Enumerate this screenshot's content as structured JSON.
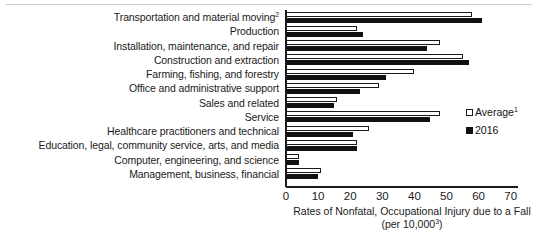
{
  "chart_data": {
    "type": "bar",
    "orientation": "horizontal",
    "title": "",
    "xlabel": "Rates of Nonfatal, Occupational Injury due to a Fall (per 10,000³)",
    "xlabel_line1": "Rates of Nonfatal, Occupational Injury due to a Fall",
    "xlabel_line2_prefix": "(per 10,000",
    "xlabel_line2_sup": "3",
    "xlabel_line2_suffix": ")",
    "ylabel": "",
    "xlim": [
      0,
      70
    ],
    "xticks": [
      0,
      10,
      20,
      30,
      40,
      50,
      60,
      70
    ],
    "xtick_labels": [
      "0",
      "10",
      "20",
      "30",
      "40",
      "50",
      "60",
      "70"
    ],
    "grid": false,
    "legend_position": "center-right",
    "categories": [
      "Transportation and material moving²",
      "Production",
      "Installation, maintenance, and repair",
      "Construction and extraction",
      "Farming, fishing, and forestry",
      "Office and administrative support",
      "Sales and related",
      "Service",
      "Healthcare practitioners and technical",
      "Education, legal, community service, arts, and media",
      "Computer, engineering, and science",
      "Management, business, financial"
    ],
    "categories_plain": [
      "Transportation and material moving",
      "Production",
      "Installation, maintenance, and repair",
      "Construction and extraction",
      "Farming, fishing, and forestry",
      "Office and administrative support",
      "Sales and related",
      "Service",
      "Healthcare practitioners and technical",
      "Education, legal, community service, arts, and media",
      "Computer, engineering, and science",
      "Management, business, financial"
    ],
    "category_footnotes": [
      "2",
      "",
      "",
      "",
      "",
      "",
      "",
      "",
      "",
      "",
      "",
      ""
    ],
    "series": [
      {
        "name": "Average¹",
        "key": "average",
        "style": "hollow",
        "color": "#ffffff",
        "edge_color": "#1a1a1a",
        "values": [
          58,
          22,
          48,
          55,
          40,
          29,
          16,
          48,
          26,
          22,
          4,
          11
        ]
      },
      {
        "name": "2016",
        "key": "current",
        "style": "solid",
        "color": "#111111",
        "edge_color": "#111111",
        "values": [
          61,
          24,
          44,
          57,
          31,
          23,
          15,
          45,
          21,
          22,
          4,
          10
        ]
      }
    ]
  },
  "legend": {
    "items": [
      {
        "label": "Average",
        "sup": "1",
        "style": "hollow"
      },
      {
        "label": "2016",
        "sup": "",
        "style": "solid"
      }
    ]
  }
}
